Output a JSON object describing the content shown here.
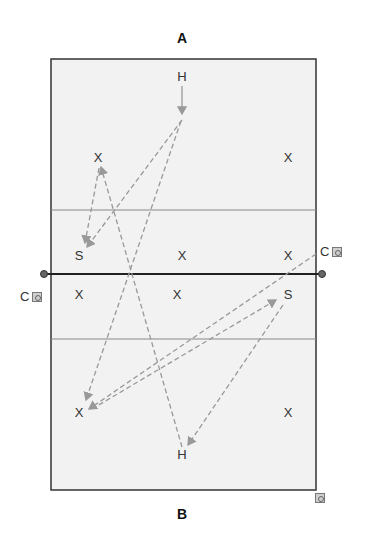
{
  "teams": {
    "top_label": "A",
    "bottom_label": "B"
  },
  "court": {
    "background": "#f2f2f2",
    "border_color": "#333333",
    "attack_line_color": "#888888",
    "net_color": "#222222",
    "arrow_color": "#999999"
  },
  "players": [
    {
      "id": "a-h",
      "label": "H",
      "x": 182,
      "y": 77
    },
    {
      "id": "a-x1",
      "label": "X",
      "x": 98,
      "y": 158
    },
    {
      "id": "a-x2",
      "label": "X",
      "x": 288,
      "y": 158
    },
    {
      "id": "a-s",
      "label": "S",
      "x": 79,
      "y": 256
    },
    {
      "id": "a-x3",
      "label": "X",
      "x": 182,
      "y": 256
    },
    {
      "id": "a-x4",
      "label": "X",
      "x": 288,
      "y": 256
    },
    {
      "id": "b-x1",
      "label": "X",
      "x": 79,
      "y": 295
    },
    {
      "id": "b-x2",
      "label": "X",
      "x": 177,
      "y": 295
    },
    {
      "id": "b-s",
      "label": "S",
      "x": 288,
      "y": 295
    },
    {
      "id": "b-x3",
      "label": "X",
      "x": 79,
      "y": 413
    },
    {
      "id": "b-x4",
      "label": "X",
      "x": 288,
      "y": 413
    },
    {
      "id": "b-h",
      "label": "H",
      "x": 182,
      "y": 455
    }
  ],
  "coaches": [
    {
      "id": "coach-a",
      "label": "C",
      "x": 320,
      "y": 246
    },
    {
      "id": "coach-b",
      "label": "C",
      "x": 20,
      "y": 290
    },
    {
      "id": "coach-extra",
      "label": "",
      "x": 315,
      "y": 493
    }
  ]
}
